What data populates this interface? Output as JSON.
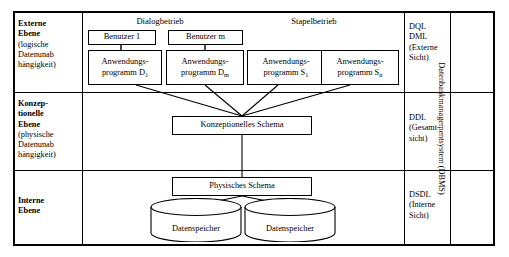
{
  "diagram": {
    "title_vertical": "Datenbankmanagementsystem (DBMS)",
    "levels": [
      {
        "name": "externe-ebene",
        "line1": "Externe",
        "line2": "Ebene",
        "line3": "(logische",
        "line4": "Datenunab",
        "line5": "hängigkeit)"
      },
      {
        "name": "konzeptionelle-ebene",
        "line1": "Konzep-",
        "line2": "tionelle",
        "line3": "Ebene",
        "line4": "(physische",
        "line5": "Datenunab",
        "line6": "hängigkeit)"
      },
      {
        "name": "interne-ebene",
        "line1": "Interne",
        "line2": "Ebene"
      }
    ],
    "languages": [
      {
        "name": "dql-dml",
        "line1": "DQL",
        "line2": "DML",
        "line3": "(Externe",
        "line4": "Sicht)"
      },
      {
        "name": "ddl",
        "line1": "DDL",
        "line2": "(Gesamt-",
        "line3": "sicht)"
      },
      {
        "name": "dsdl",
        "line1": "DSDL",
        "line2": "(Interne",
        "line3": "Sicht)"
      }
    ],
    "modes": {
      "dialog": "Dialogbetrieb",
      "stapel": "Stapelbetrieb"
    },
    "users": [
      {
        "name": "benutzer-1",
        "label": "Benutzer 1"
      },
      {
        "name": "benutzer-m",
        "label": "Benutzer m"
      }
    ],
    "programs": [
      {
        "name": "anwendungsprogramm-d1",
        "line1": "Anwendungs-",
        "line2": "programm D",
        "sub": "1"
      },
      {
        "name": "anwendungsprogramm-dm",
        "line1": "Anwendungs-",
        "line2": "programm D",
        "sub": "m"
      },
      {
        "name": "anwendungsprogramm-s1",
        "line1": "Anwendungs-",
        "line2": "programm S",
        "sub": "1"
      },
      {
        "name": "anwendungsprogramm-sn",
        "line1": "Anwendungs-",
        "line2": "programm S",
        "sub": "n"
      }
    ],
    "schemas": {
      "konzeptionell": "Konzeptionelles Schema",
      "physisch": "Physisches Schema"
    },
    "stores": [
      {
        "name": "datenspeicher-1",
        "label": "Datenspeicher"
      },
      {
        "name": "datenspeicher-2",
        "label": "Datenspeicher"
      }
    ],
    "colors": {
      "line": "#000000",
      "background": "#ffffff"
    }
  }
}
